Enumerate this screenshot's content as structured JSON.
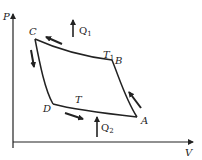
{
  "diagram": {
    "type": "PV cycle",
    "axes": {
      "y_label": "P",
      "x_label": "V"
    },
    "points": {
      "C": "C",
      "B": "B",
      "D": "D",
      "A": "A"
    },
    "temperatures": {
      "upper": {
        "main": "T",
        "sub": "1"
      },
      "lower": {
        "main": "T",
        "sub": ""
      }
    },
    "heat": {
      "q1": {
        "main": "Q",
        "sub": "1"
      },
      "q2": {
        "main": "Q",
        "sub": "2"
      }
    },
    "colors": {
      "ink": "#222222",
      "background": "#ffffff"
    }
  }
}
